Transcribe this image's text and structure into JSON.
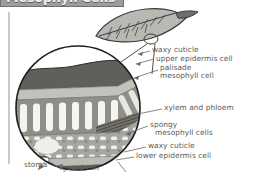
{
  "figure": {
    "title": "Mesophyll Cells",
    "title_visible_fragment": "phyll Cells",
    "colors": {
      "title_bar": "#9d9d9d",
      "title_text": "#f2f2f2",
      "label_text": "#5a5a58",
      "cuticle_dark": "#5c5c5a",
      "epidermis": "#b8b8b4",
      "palisade": "#8d8d88",
      "spongy": "#a2a29d",
      "vein": "#6e6e6a",
      "outline": "#2b2b2b",
      "leader_line": "#6a6a66",
      "page_edge": "#c9c9c9"
    }
  },
  "leaf_icon": {
    "name": "whole-leaf-illustration",
    "description": "single leaf with midrib, lateral veins and petiole"
  },
  "magnifier": {
    "name": "magnified-cross-section",
    "description": "circular cutaway showing leaf tissue layers in 3D block"
  },
  "labels": [
    {
      "id": "waxy-cuticle-upper",
      "text": "waxy cuticle",
      "x": 152,
      "y": 48
    },
    {
      "id": "upper-epidermis-cell",
      "text": "upper epidermis cell",
      "x": 156,
      "y": 57
    },
    {
      "id": "palisade",
      "text": "palisade",
      "x": 160,
      "y": 66
    },
    {
      "id": "mesophyll-cell",
      "text": "mesophyll cell",
      "x": 160,
      "y": 74
    },
    {
      "id": "xylem-and-phloem",
      "text": "xylem and phloem",
      "x": 164,
      "y": 107
    },
    {
      "id": "spongy",
      "text": "spongy",
      "x": 150,
      "y": 124
    },
    {
      "id": "mesophyll-cells",
      "text": "mesophyll cells",
      "x": 155,
      "y": 132
    },
    {
      "id": "waxy-cuticle-lower",
      "text": "waxy cuticle",
      "x": 148,
      "y": 145
    },
    {
      "id": "lower-epidermis-cell",
      "text": "lower epidermis cell",
      "x": 136,
      "y": 155
    },
    {
      "id": "stoma",
      "text": "stoma",
      "x": 24,
      "y": 163
    },
    {
      "id": "guard-cell",
      "text": "guard cell",
      "x": 62,
      "y": 166
    }
  ]
}
